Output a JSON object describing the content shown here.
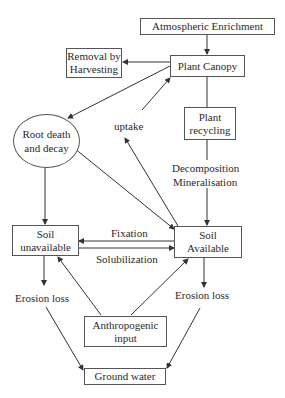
{
  "diagram": {
    "nodes": {
      "atmospheric": {
        "label": "Atmospheric Enrichment"
      },
      "canopy": {
        "label": "Plant Canopy"
      },
      "removal": {
        "line1": "Removal by",
        "line2": "Harvesting"
      },
      "recycling": {
        "line1": "Plant",
        "line2": "recycling"
      },
      "root": {
        "line1": "Root death",
        "line2": "and decay"
      },
      "soil_unavailable": {
        "line1": "Soil",
        "line2": "unavailable"
      },
      "soil_available": {
        "line1": "Soil",
        "line2": "Available"
      },
      "anthropogenic": {
        "line1": "Anthropogenic",
        "line2": "input"
      },
      "groundwater": {
        "label": "Ground water"
      }
    },
    "edge_labels": {
      "uptake": "uptake",
      "decomposition": "Decomposition",
      "mineralisation": "Mineralisation",
      "fixation": "Fixation",
      "solubilization": "Solubilization",
      "erosion_left": "Erosion loss",
      "erosion_right": "Erosion loss"
    },
    "edges": [
      {
        "from": "Atmospheric Enrichment",
        "to": "Plant Canopy"
      },
      {
        "from": "Plant Canopy",
        "to": "Removal by Harvesting"
      },
      {
        "from": "Plant Canopy",
        "to": "Root death and decay"
      },
      {
        "from": "Plant Canopy",
        "to": "Plant recycling"
      },
      {
        "from": "Plant recycling",
        "to": "Soil Available",
        "label": "Decomposition Mineralisation"
      },
      {
        "from": "Soil Available",
        "to": "Plant Canopy",
        "label": "uptake"
      },
      {
        "from": "Root death and decay",
        "to": "Soil unavailable"
      },
      {
        "from": "Root death and decay",
        "to": "Soil Available"
      },
      {
        "from": "Soil Available",
        "to": "Soil unavailable",
        "label": "Fixation"
      },
      {
        "from": "Soil unavailable",
        "to": "Soil Available",
        "label": "Solubilization"
      },
      {
        "from": "Soil unavailable",
        "to": "Erosion loss"
      },
      {
        "from": "Soil Available",
        "to": "Erosion loss"
      },
      {
        "from": "Anthropogenic input",
        "to": "Soil unavailable"
      },
      {
        "from": "Anthropogenic input",
        "to": "Soil Available"
      },
      {
        "from": "Erosion loss (left)",
        "to": "Ground water"
      },
      {
        "from": "Erosion loss (right)",
        "to": "Ground water"
      }
    ]
  }
}
